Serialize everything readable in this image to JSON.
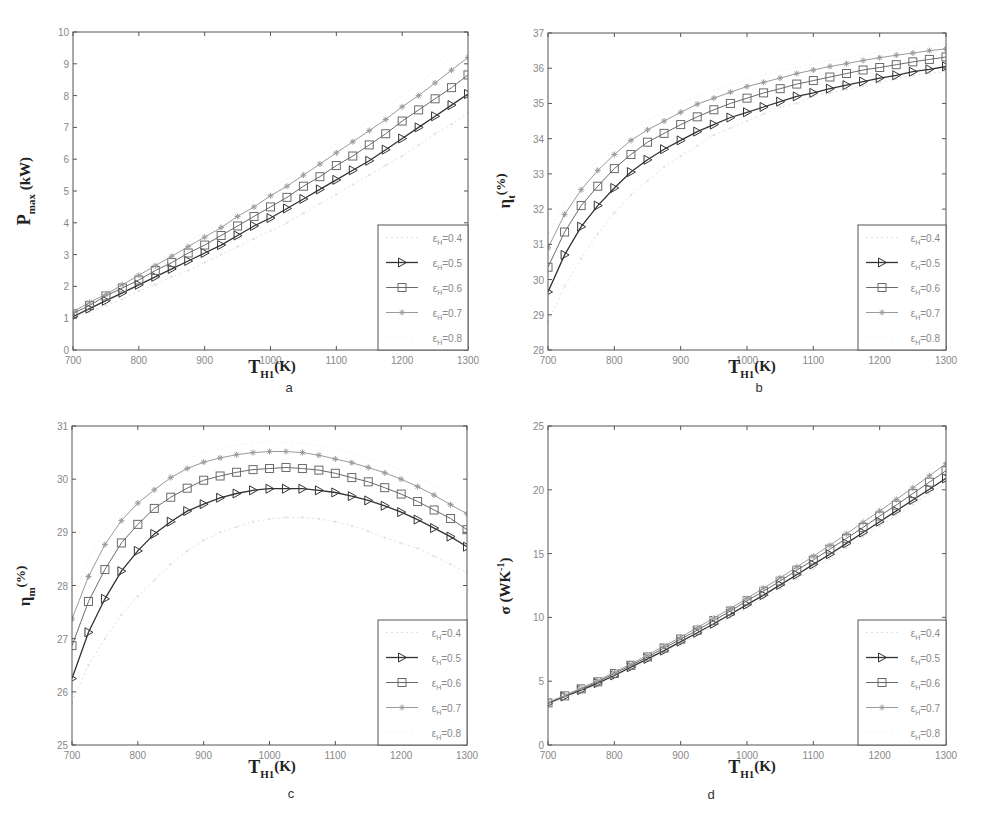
{
  "figure": {
    "panels": [
      "a",
      "b",
      "c",
      "d"
    ]
  },
  "legend_labels": [
    "ε_H=0.4",
    "ε_H=0.5",
    "ε_H=0.6",
    "ε_H=0.7",
    "ε_H=0.8"
  ],
  "series_styles": [
    {
      "name": "εH=0.4",
      "color": "#e2e2e2",
      "marker": "dot",
      "dash": "2,3",
      "width": 1
    },
    {
      "name": "εH=0.5",
      "color": "#333333",
      "marker": "triangle-right",
      "dash": "",
      "width": 1.3
    },
    {
      "name": "εH=0.6",
      "color": "#6a6a6a",
      "marker": "square",
      "dash": "",
      "width": 1
    },
    {
      "name": "εH=0.7",
      "color": "#9a9a9a",
      "marker": "star",
      "dash": "",
      "width": 1
    },
    {
      "name": "εH=0.8",
      "color": "#f2f2f2",
      "marker": "none",
      "dash": "2,3",
      "width": 1
    }
  ],
  "chart_data": [
    {
      "panel": "a",
      "type": "line",
      "title": "",
      "xlabel": "T_H1(K)",
      "ylabel": "P_max (kW)",
      "xlim": [
        700,
        1300
      ],
      "ylim": [
        0,
        10
      ],
      "xticks": [
        700,
        800,
        900,
        1000,
        1100,
        1200,
        1300
      ],
      "yticks": [
        0,
        1,
        2,
        3,
        4,
        5,
        6,
        7,
        8,
        9,
        10
      ],
      "grid": false,
      "legend_position": "lower right",
      "x": [
        700,
        725,
        750,
        775,
        800,
        825,
        850,
        875,
        900,
        925,
        950,
        975,
        1000,
        1025,
        1050,
        1075,
        1100,
        1125,
        1150,
        1175,
        1200,
        1225,
        1250,
        1275,
        1300
      ],
      "series": [
        {
          "name": "εH=0.4",
          "values": [
            1.0,
            1.2,
            1.4,
            1.6,
            1.85,
            2.05,
            2.3,
            2.5,
            2.75,
            3.0,
            3.25,
            3.5,
            3.75,
            4.0,
            4.3,
            4.6,
            4.9,
            5.2,
            5.5,
            5.8,
            6.1,
            6.45,
            6.8,
            7.1,
            7.45
          ]
        },
        {
          "name": "εH=0.5",
          "values": [
            1.05,
            1.3,
            1.55,
            1.8,
            2.05,
            2.3,
            2.55,
            2.8,
            3.05,
            3.3,
            3.6,
            3.9,
            4.15,
            4.45,
            4.75,
            5.05,
            5.35,
            5.65,
            5.95,
            6.3,
            6.65,
            7.0,
            7.35,
            7.7,
            8.05
          ]
        },
        {
          "name": "εH=0.6",
          "values": [
            1.15,
            1.4,
            1.7,
            1.95,
            2.2,
            2.5,
            2.75,
            3.05,
            3.3,
            3.6,
            3.9,
            4.2,
            4.5,
            4.8,
            5.15,
            5.45,
            5.8,
            6.1,
            6.45,
            6.8,
            7.2,
            7.55,
            7.9,
            8.25,
            8.65
          ]
        },
        {
          "name": "εH=0.7",
          "values": [
            1.2,
            1.5,
            1.75,
            2.05,
            2.35,
            2.65,
            2.95,
            3.25,
            3.55,
            3.85,
            4.2,
            4.5,
            4.85,
            5.15,
            5.5,
            5.85,
            6.2,
            6.55,
            6.9,
            7.25,
            7.65,
            8.0,
            8.4,
            8.8,
            9.2
          ]
        },
        {
          "name": "εH=0.8",
          "values": [
            1.25,
            1.55,
            1.85,
            2.15,
            2.45,
            2.75,
            3.05,
            3.4,
            3.7,
            4.0,
            4.35,
            4.7,
            5.05,
            5.4,
            5.75,
            6.1,
            6.5,
            6.85,
            7.25,
            7.6,
            8.0,
            8.4,
            8.8,
            9.2,
            9.6
          ]
        }
      ]
    },
    {
      "panel": "b",
      "type": "line",
      "title": "",
      "xlabel": "T_H1(K)",
      "ylabel": "η_t(%)",
      "xlim": [
        700,
        1300
      ],
      "ylim": [
        28,
        37
      ],
      "xticks": [
        700,
        800,
        900,
        1000,
        1100,
        1200,
        1300
      ],
      "yticks": [
        28,
        29,
        30,
        31,
        32,
        33,
        34,
        35,
        36,
        37
      ],
      "grid": false,
      "legend_position": "lower right",
      "x": [
        700,
        725,
        750,
        775,
        800,
        825,
        850,
        875,
        900,
        925,
        950,
        975,
        1000,
        1025,
        1050,
        1075,
        1100,
        1125,
        1150,
        1175,
        1200,
        1225,
        1250,
        1275,
        1300
      ],
      "series": [
        {
          "name": "εH=0.4",
          "values": [
            28.8,
            29.8,
            30.6,
            31.3,
            31.9,
            32.4,
            32.8,
            33.2,
            33.5,
            33.8,
            34.1,
            34.3,
            34.5,
            34.7,
            34.9,
            35.0,
            35.2,
            35.3,
            35.4,
            35.5,
            35.6,
            35.7,
            35.8,
            35.85,
            35.9
          ]
        },
        {
          "name": "εH=0.5",
          "values": [
            29.65,
            30.7,
            31.5,
            32.1,
            32.6,
            33.05,
            33.4,
            33.7,
            33.95,
            34.2,
            34.4,
            34.6,
            34.75,
            34.9,
            35.05,
            35.2,
            35.3,
            35.42,
            35.52,
            35.62,
            35.72,
            35.8,
            35.9,
            35.97,
            36.05
          ]
        },
        {
          "name": "εH=0.6",
          "values": [
            30.35,
            31.35,
            32.1,
            32.65,
            33.15,
            33.55,
            33.9,
            34.15,
            34.4,
            34.62,
            34.82,
            35.0,
            35.15,
            35.3,
            35.42,
            35.55,
            35.65,
            35.75,
            35.85,
            35.95,
            36.02,
            36.1,
            36.18,
            36.25,
            36.32
          ]
        },
        {
          "name": "εH=0.7",
          "values": [
            30.9,
            31.85,
            32.55,
            33.1,
            33.55,
            33.95,
            34.25,
            34.5,
            34.75,
            34.98,
            35.15,
            35.32,
            35.48,
            35.6,
            35.72,
            35.85,
            35.95,
            36.05,
            36.13,
            36.22,
            36.3,
            36.37,
            36.43,
            36.5,
            36.55
          ]
        },
        {
          "name": "εH=0.8",
          "values": [
            31.3,
            32.2,
            32.9,
            33.4,
            33.85,
            34.2,
            34.5,
            34.75,
            35.0,
            35.2,
            35.37,
            35.53,
            35.68,
            35.8,
            35.92,
            36.03,
            36.12,
            36.22,
            36.3,
            36.38,
            36.46,
            36.53,
            36.6,
            36.65,
            36.7
          ]
        }
      ]
    },
    {
      "panel": "c",
      "type": "line",
      "title": "",
      "xlabel": "T_H1(K)",
      "ylabel": "η_m(%)",
      "xlim": [
        700,
        1300
      ],
      "ylim": [
        25,
        31
      ],
      "xticks": [
        700,
        800,
        900,
        1000,
        1100,
        1200,
        1300
      ],
      "yticks": [
        25,
        26,
        27,
        28,
        29,
        30,
        31
      ],
      "grid": false,
      "legend_position": "lower right",
      "x": [
        700,
        725,
        750,
        775,
        800,
        825,
        850,
        875,
        900,
        925,
        950,
        975,
        1000,
        1025,
        1050,
        1075,
        1100,
        1125,
        1150,
        1175,
        1200,
        1225,
        1250,
        1275,
        1300
      ],
      "series": [
        {
          "name": "εH=0.4",
          "values": [
            25.8,
            26.5,
            27.0,
            27.45,
            27.8,
            28.1,
            28.4,
            28.65,
            28.85,
            29.0,
            29.1,
            29.2,
            29.25,
            29.28,
            29.28,
            29.25,
            29.2,
            29.12,
            29.02,
            28.9,
            28.8,
            28.7,
            28.55,
            28.4,
            28.25
          ]
        },
        {
          "name": "εH=0.5",
          "values": [
            26.25,
            27.12,
            27.75,
            28.27,
            28.65,
            28.97,
            29.2,
            29.4,
            29.53,
            29.65,
            29.73,
            29.79,
            29.82,
            29.82,
            29.82,
            29.79,
            29.75,
            29.68,
            29.6,
            29.5,
            29.38,
            29.24,
            29.08,
            28.92,
            28.73
          ]
        },
        {
          "name": "εH=0.6",
          "values": [
            26.87,
            27.7,
            28.3,
            28.8,
            29.15,
            29.45,
            29.66,
            29.83,
            29.98,
            30.06,
            30.13,
            30.18,
            30.2,
            30.22,
            30.2,
            30.17,
            30.11,
            30.03,
            29.95,
            29.84,
            29.72,
            29.58,
            29.42,
            29.26,
            29.05
          ]
        },
        {
          "name": "εH=0.7",
          "values": [
            27.37,
            28.17,
            28.77,
            29.22,
            29.55,
            29.8,
            30.03,
            30.2,
            30.32,
            30.4,
            30.46,
            30.5,
            30.52,
            30.52,
            30.5,
            30.45,
            30.38,
            30.31,
            30.22,
            30.12,
            30.0,
            29.86,
            29.7,
            29.52,
            29.35
          ]
        },
        {
          "name": "εH=0.8",
          "values": [
            27.7,
            28.5,
            29.05,
            29.45,
            29.78,
            30.02,
            30.22,
            30.38,
            30.5,
            30.58,
            30.64,
            30.68,
            30.7,
            30.7,
            30.68,
            30.63,
            30.57,
            30.49,
            30.4,
            30.3,
            30.18,
            30.04,
            29.88,
            29.72,
            29.55
          ]
        }
      ]
    },
    {
      "panel": "d",
      "type": "line",
      "title": "",
      "xlabel": "T_H1(K)",
      "ylabel": "σ (WK^-1)",
      "xlim": [
        700,
        1300
      ],
      "ylim": [
        0,
        25
      ],
      "xticks": [
        700,
        800,
        900,
        1000,
        1100,
        1200,
        1300
      ],
      "yticks": [
        0,
        5,
        10,
        15,
        20,
        25
      ],
      "grid": false,
      "legend_position": "lower right",
      "x": [
        700,
        725,
        750,
        775,
        800,
        825,
        850,
        875,
        900,
        925,
        950,
        975,
        1000,
        1025,
        1050,
        1075,
        1100,
        1125,
        1150,
        1175,
        1200,
        1225,
        1250,
        1275,
        1300
      ],
      "series": [
        {
          "name": "εH=0.4",
          "values": [
            3.2,
            3.7,
            4.2,
            4.75,
            5.35,
            5.95,
            6.6,
            7.25,
            7.9,
            8.6,
            9.3,
            10.0,
            10.75,
            11.5,
            12.25,
            13.0,
            13.8,
            14.6,
            15.45,
            16.3,
            17.15,
            18.0,
            18.85,
            19.7,
            20.55
          ]
        },
        {
          "name": "εH=0.5",
          "values": [
            3.25,
            3.8,
            4.3,
            4.85,
            5.45,
            6.1,
            6.75,
            7.4,
            8.1,
            8.8,
            9.5,
            10.25,
            11.0,
            11.75,
            12.55,
            13.35,
            14.15,
            14.95,
            15.8,
            16.65,
            17.5,
            18.35,
            19.2,
            20.05,
            20.9
          ]
        },
        {
          "name": "εH=0.6",
          "values": [
            3.3,
            3.85,
            4.4,
            4.95,
            5.6,
            6.25,
            6.9,
            7.6,
            8.3,
            9.0,
            9.75,
            10.5,
            11.3,
            12.05,
            12.85,
            13.7,
            14.5,
            15.35,
            16.2,
            17.05,
            17.95,
            18.8,
            19.7,
            20.6,
            21.5
          ]
        },
        {
          "name": "εH=0.7",
          "values": [
            3.35,
            3.9,
            4.45,
            5.05,
            5.7,
            6.35,
            7.05,
            7.75,
            8.45,
            9.2,
            9.95,
            10.7,
            11.5,
            12.3,
            13.1,
            13.95,
            14.8,
            15.65,
            16.55,
            17.45,
            18.35,
            19.25,
            20.15,
            21.1,
            22.05
          ]
        },
        {
          "name": "εH=0.8",
          "values": [
            3.4,
            3.95,
            4.55,
            5.15,
            5.8,
            6.45,
            7.15,
            7.9,
            8.6,
            9.35,
            10.1,
            10.9,
            11.7,
            12.5,
            13.35,
            14.2,
            15.05,
            15.95,
            16.85,
            17.75,
            18.65,
            19.6,
            20.55,
            21.5,
            22.45
          ]
        }
      ]
    }
  ],
  "layout": {
    "panels": [
      {
        "plot": [
          73,
          32,
          468,
          350
        ],
        "legend": [
          378,
          225,
          468,
          350
        ],
        "label_pos": [
          289,
          392
        ],
        "xlabel_pos": [
          272,
          373
        ],
        "ylabel_pos": [
          30,
          191
        ]
      },
      {
        "plot": [
          548,
          33,
          946,
          350
        ],
        "legend": [
          858,
          225,
          946,
          350
        ],
        "label_pos": [
          759,
          392
        ],
        "xlabel_pos": [
          752,
          373
        ],
        "ylabel_pos": [
          510,
          191
        ]
      },
      {
        "plot": [
          72,
          426,
          467,
          745
        ],
        "legend": [
          378,
          620,
          467,
          745
        ],
        "label_pos": [
          291,
          798
        ],
        "xlabel_pos": [
          272,
          773
        ],
        "ylabel_pos": [
          30,
          586
        ]
      },
      {
        "plot": [
          548,
          426,
          946,
          745
        ],
        "legend": [
          858,
          620,
          946,
          745
        ],
        "label_pos": [
          711,
          799
        ],
        "xlabel_pos": [
          752,
          773
        ],
        "ylabel_pos": [
          510,
          586
        ]
      }
    ]
  }
}
